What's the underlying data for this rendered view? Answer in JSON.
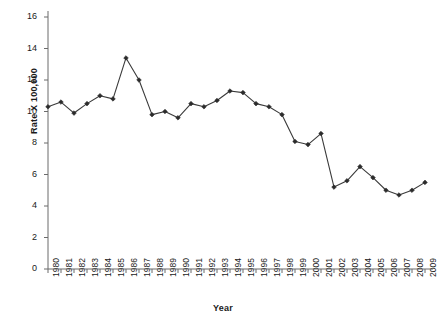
{
  "chart_data": {
    "type": "line",
    "title": "",
    "xlabel": "Year",
    "ylabel": "Rate X 100,000",
    "ylim": [
      0,
      16
    ],
    "yticks": [
      0,
      2,
      4,
      6,
      8,
      10,
      12,
      14,
      16
    ],
    "grid": false,
    "legend": "none",
    "marker": "filled-diamond",
    "line_color": "#3a3a3a",
    "categories": [
      "1980",
      "1981",
      "1982",
      "1983",
      "1984",
      "1985",
      "1986",
      "1987",
      "1988",
      "1989",
      "1990",
      "1991",
      "1992",
      "1993",
      "1994",
      "1995",
      "1996",
      "1997",
      "1998",
      "1999",
      "2000",
      "2001",
      "2002",
      "2003",
      "2004",
      "2005",
      "2006",
      "2007",
      "2008",
      "2009"
    ],
    "values": [
      10.3,
      10.6,
      9.9,
      10.5,
      11.0,
      10.8,
      13.4,
      12.0,
      9.8,
      10.0,
      9.6,
      10.5,
      10.3,
      10.7,
      11.3,
      11.2,
      10.5,
      10.3,
      9.8,
      8.1,
      7.9,
      8.6,
      5.2,
      5.6,
      6.5,
      5.8,
      5.0,
      4.7,
      5.0,
      5.5
    ],
    "x": [
      1980,
      1981,
      1982,
      1983,
      1984,
      1985,
      1986,
      1987,
      1988,
      1989,
      1990,
      1991,
      1992,
      1993,
      1994,
      1995,
      1996,
      1997,
      1998,
      1999,
      2000,
      2001,
      2002,
      2003,
      2004,
      2005,
      2006,
      2007,
      2008,
      2009
    ]
  },
  "axes": {
    "y_tick_labels": [
      "16",
      "14",
      "12",
      "10",
      "8",
      "6",
      "4",
      "2",
      "0"
    ],
    "y_axis_label": "Rate X 100,000",
    "x_axis_label": "Year"
  }
}
